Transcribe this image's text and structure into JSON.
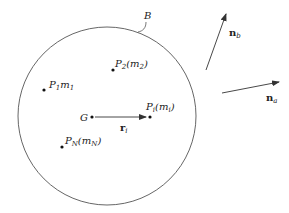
{
  "diagram": {
    "body_label": "B",
    "centroid_label": "G",
    "points": [
      {
        "name": "P",
        "sub": "1",
        "mass": "m",
        "mass_sub": "1",
        "format": "plain"
      },
      {
        "name": "P",
        "sub": "2",
        "mass": "m",
        "mass_sub": "2",
        "format": "paren"
      },
      {
        "name": "P",
        "sub": "i",
        "mass": "m",
        "mass_sub": "i",
        "format": "paren"
      },
      {
        "name": "P",
        "sub": "N",
        "mass": "m",
        "mass_sub": "N",
        "format": "paren"
      }
    ],
    "position_vector": {
      "name": "r",
      "sub": "i"
    },
    "unit_vectors": [
      {
        "name": "n",
        "sub": "b"
      },
      {
        "name": "n",
        "sub": "a"
      }
    ],
    "colors": {
      "line": "#333333",
      "background": "#ffffff"
    }
  }
}
